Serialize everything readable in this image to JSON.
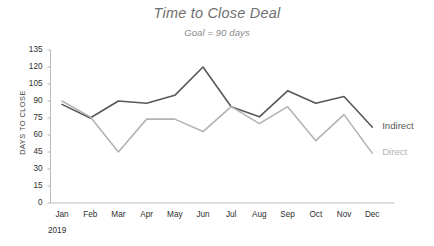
{
  "chart_data": {
    "type": "line",
    "title": "Time to Close Deal",
    "subtitle": "Goal = 90 days",
    "xlabel": "",
    "ylabel": "DAYS TO CLOSE",
    "x_year": "2019",
    "categories": [
      "Jan",
      "Feb",
      "Mar",
      "Apr",
      "May",
      "Jun",
      "Jul",
      "Aug",
      "Sep",
      "Oct",
      "Nov",
      "Dec"
    ],
    "ylim": [
      0,
      135
    ],
    "ytick_step": 15,
    "ytick_labels": [
      "135",
      "120",
      "105",
      "90",
      "75",
      "60",
      "45",
      "30",
      "15",
      "0"
    ],
    "grid": false,
    "legend_position": "right-inline",
    "series": [
      {
        "name": "Indirect",
        "color": "#585858",
        "values": [
          87,
          75,
          90,
          88,
          95,
          120,
          85,
          76,
          99,
          88,
          94,
          67
        ]
      },
      {
        "name": "Direct",
        "color": "#b3b3b3",
        "values": [
          90,
          76,
          45,
          74,
          74,
          63,
          85,
          70,
          85,
          55,
          78,
          44
        ]
      }
    ]
  },
  "axis": {
    "line_color": "#b9b9b9",
    "tick_color": "#b9b9b9"
  }
}
